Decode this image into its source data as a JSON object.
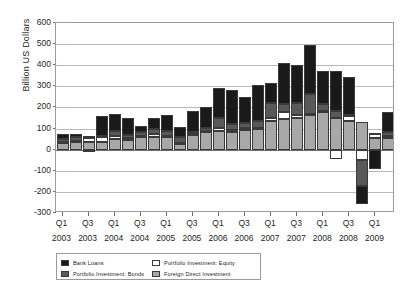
{
  "chart_data": {
    "type": "bar",
    "stacked": true,
    "title": "",
    "subtitle": "",
    "xlabel": "",
    "ylabel": "Billion US Dollars",
    "ylim": [
      -300,
      600
    ],
    "ytick_values": [
      600,
      500,
      400,
      300,
      200,
      100,
      0,
      -100,
      -200,
      -300
    ],
    "ytick_labels": [
      "600",
      "500",
      "400",
      "300",
      "200",
      "100",
      "0",
      "-100",
      "-200",
      "-300"
    ],
    "grid": true,
    "legend_position": "bottom-left",
    "categories": [
      "Q1 2003",
      "Q2 2003",
      "Q3 2003",
      "Q4 2003",
      "Q1 2004",
      "Q2 2004",
      "Q3 2004",
      "Q4 2004",
      "Q1 2005",
      "Q2 2005",
      "Q3 2005",
      "Q4 2005",
      "Q1 2006",
      "Q2 2006",
      "Q3 2006",
      "Q4 2006",
      "Q1 2007",
      "Q2 2007",
      "Q3 2007",
      "Q4 2007",
      "Q1 2008",
      "Q2 2008",
      "Q3 2008",
      "Q4 2008",
      "Q1 2009",
      "Q2 2009"
    ],
    "xtick_labels": [
      {
        "quarter": "Q1",
        "year": "2003",
        "index": 0
      },
      {
        "quarter": "Q3",
        "year": "2003",
        "index": 2
      },
      {
        "quarter": "Q1",
        "year": "2004",
        "index": 4
      },
      {
        "quarter": "Q3",
        "year": "2004",
        "index": 6
      },
      {
        "quarter": "Q1",
        "year": "2005",
        "index": 8
      },
      {
        "quarter": "Q3",
        "year": "2005",
        "index": 10
      },
      {
        "quarter": "Q1",
        "year": "2006",
        "index": 12
      },
      {
        "quarter": "Q3",
        "year": "2006",
        "index": 14
      },
      {
        "quarter": "Q1",
        "year": "2007",
        "index": 16
      },
      {
        "quarter": "Q3",
        "year": "2007",
        "index": 18
      },
      {
        "quarter": "Q1",
        "year": "2008",
        "index": 20
      },
      {
        "quarter": "Q3",
        "year": "2008",
        "index": 22
      },
      {
        "quarter": "Q1",
        "year": "2009",
        "index": 24
      }
    ],
    "series": [
      {
        "name": "Foreign Direct Investment",
        "color": "#a8a8a8",
        "values": [
          30,
          36,
          38,
          34,
          52,
          46,
          58,
          62,
          58,
          26,
          70,
          82,
          88,
          84,
          92,
          100,
          136,
          144,
          150,
          162,
          178,
          152,
          138,
          132,
          54,
          56
        ]
      },
      {
        "name": "Portfolio Investment: Equity",
        "color": "#ffffff",
        "values": [
          6,
          6,
          18,
          24,
          14,
          10,
          8,
          14,
          8,
          4,
          4,
          6,
          16,
          8,
          10,
          4,
          16,
          36,
          12,
          6,
          4,
          -46,
          22,
          -48,
          22,
          8
        ]
      },
      {
        "name": "Portfolio Investment: Bonds",
        "color": "#595959",
        "values": [
          14,
          18,
          8,
          6,
          22,
          14,
          16,
          20,
          22,
          30,
          12,
          16,
          46,
          28,
          26,
          34,
          68,
          34,
          60,
          96,
          36,
          32,
          2,
          -124,
          4,
          18
        ]
      },
      {
        "name": "Bank Loans",
        "color": "#1a1a1a",
        "values": [
          24,
          16,
          -4,
          96,
          80,
          78,
          32,
          54,
          74,
          46,
          98,
          100,
          144,
          164,
          122,
          166,
          96,
          196,
          180,
          234,
          156,
          190,
          184,
          -84,
          -92,
          98
        ]
      }
    ]
  },
  "legend": {
    "items": [
      {
        "label": "Bank Loans",
        "color": "#1a1a1a"
      },
      {
        "label": "Portfolio Investment: Equity",
        "color": "#ffffff"
      },
      {
        "label": "Portfolio Investment: Bonds",
        "color": "#595959"
      },
      {
        "label": "Foreign Direct Investment",
        "color": "#a8a8a8"
      }
    ]
  },
  "axis": {
    "y_title": "Billion US Dollars"
  }
}
